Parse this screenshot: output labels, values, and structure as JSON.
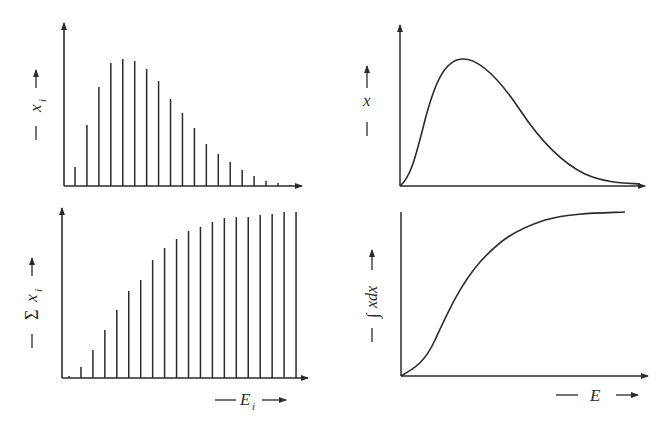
{
  "panels": {
    "top_left": {
      "ylabel": "x",
      "ylabel_sub": "i"
    },
    "bottom_left": {
      "ylabel": "Σ x",
      "ylabel_sub": "i",
      "xlabel": "E",
      "xlabel_sub": "i"
    },
    "top_right": {
      "ylabel": "x"
    },
    "bottom_right": {
      "ylabel": "∫xdx",
      "xlabel": "E"
    }
  },
  "chart_data": [
    {
      "type": "bar",
      "title": "Discrete distribution",
      "ylabel": "x_i",
      "xlabel": "E_i",
      "categories": [
        1,
        2,
        3,
        4,
        5,
        6,
        7,
        8,
        9,
        10,
        11,
        12,
        13,
        14,
        15,
        16,
        17,
        18,
        19
      ],
      "values": [
        19,
        61,
        99,
        123,
        127,
        125,
        117,
        105,
        87,
        73,
        58,
        42,
        32,
        24,
        16,
        10,
        5,
        3,
        1
      ],
      "grid": false
    },
    {
      "type": "bar",
      "title": "Cumulative discrete distribution",
      "ylabel": "Σ x_i",
      "xlabel": "E_i",
      "categories": [
        1,
        2,
        3,
        4,
        5,
        6,
        7,
        8,
        9,
        10,
        11,
        12,
        13,
        14,
        15,
        16,
        17,
        18,
        19,
        20
      ],
      "values": [
        2,
        11,
        28,
        48,
        68,
        87,
        98,
        118,
        130,
        139,
        147,
        151,
        156,
        160,
        161,
        161,
        163,
        164,
        166,
        166
      ],
      "grid": false
    },
    {
      "type": "line",
      "title": "Continuous distribution",
      "ylabel": "x",
      "xlabel": "E",
      "x": [
        0,
        0.05,
        0.1,
        0.15,
        0.2,
        0.25,
        0.3,
        0.4,
        0.5,
        0.6,
        0.7,
        0.8,
        0.9,
        1.0
      ],
      "values": [
        0,
        0.2,
        0.55,
        0.85,
        0.98,
        1.0,
        0.95,
        0.78,
        0.55,
        0.34,
        0.18,
        0.08,
        0.03,
        0.02
      ],
      "grid": false
    },
    {
      "type": "line",
      "title": "Cumulative continuous distribution",
      "ylabel": "∫xdx",
      "xlabel": "E",
      "x": [
        0,
        0.1,
        0.2,
        0.3,
        0.4,
        0.5,
        0.6,
        0.7,
        0.8,
        0.9,
        1.0
      ],
      "values": [
        0,
        0.1,
        0.3,
        0.55,
        0.75,
        0.88,
        0.95,
        0.98,
        0.99,
        1.0,
        1.0
      ],
      "grid": false
    }
  ]
}
